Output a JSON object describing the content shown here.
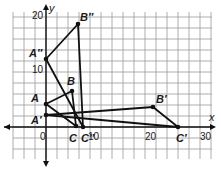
{
  "axes": {
    "x_label": "x",
    "y_label": "y",
    "x_ticks": [
      {
        "label": "0",
        "px": 40,
        "py": 140
      },
      {
        "label": "10",
        "px": 88,
        "py": 140
      },
      {
        "label": "20",
        "px": 145,
        "py": 140
      },
      {
        "label": "30",
        "px": 200,
        "py": 140
      }
    ],
    "y_ticks": [
      {
        "label": "20",
        "px": 32,
        "py": 19
      },
      {
        "label": "10",
        "px": 32,
        "py": 73
      }
    ]
  },
  "grid": {
    "x0": 13,
    "y0": 12,
    "x1": 212,
    "y1": 159,
    "spacing": 11,
    "origin_px": [
      46,
      127
    ],
    "color": "#9a9a9a"
  },
  "triangles": [
    {
      "name": "ABC",
      "points": [
        [
          46,
          104
        ],
        [
          72,
          91
        ],
        [
          76,
          126
        ]
      ]
    },
    {
      "name": "A'B'C'",
      "points": [
        [
          46,
          115
        ],
        [
          153,
          107
        ],
        [
          178,
          127
        ]
      ]
    },
    {
      "name": "A''B''C''",
      "points": [
        [
          46,
          59
        ],
        [
          78,
          24
        ],
        [
          83,
          127
        ]
      ]
    }
  ],
  "points": [
    {
      "label": "A",
      "px": 46,
      "py": 104,
      "lx": 31,
      "ly": 102
    },
    {
      "label": "B",
      "px": 72,
      "py": 91,
      "lx": 67,
      "ly": 85
    },
    {
      "label": "C",
      "px": 76,
      "py": 126,
      "lx": 69,
      "ly": 142
    },
    {
      "label": "A′",
      "px": 46,
      "py": 115,
      "lx": 31,
      "ly": 124
    },
    {
      "label": "B′",
      "px": 153,
      "py": 107,
      "lx": 156,
      "ly": 103
    },
    {
      "label": "C′",
      "px": 178,
      "py": 127,
      "lx": 176,
      "ly": 142
    },
    {
      "label": "A″",
      "px": 46,
      "py": 59,
      "lx": 29,
      "ly": 57
    },
    {
      "label": "B″",
      "px": 78,
      "py": 24,
      "lx": 80,
      "ly": 21
    },
    {
      "label": "C″",
      "px": 83,
      "py": 127,
      "lx": 81,
      "ly": 142
    }
  ]
}
